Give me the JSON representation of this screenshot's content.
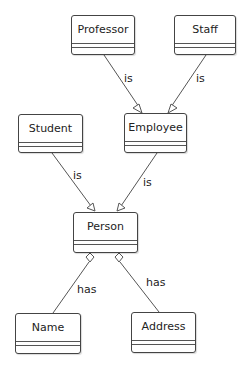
{
  "diagram": {
    "type": "uml-class-diagram",
    "classes": [
      {
        "id": "professor",
        "name": "Professor"
      },
      {
        "id": "staff",
        "name": "Staff"
      },
      {
        "id": "student",
        "name": "Student"
      },
      {
        "id": "employee",
        "name": "Employee"
      },
      {
        "id": "person",
        "name": "Person"
      },
      {
        "id": "name",
        "name": "Name"
      },
      {
        "id": "address",
        "name": "Address"
      }
    ],
    "relationships": [
      {
        "from": "Professor",
        "to": "Employee",
        "kind": "generalization",
        "label": "is"
      },
      {
        "from": "Staff",
        "to": "Employee",
        "kind": "generalization",
        "label": "is"
      },
      {
        "from": "Student",
        "to": "Person",
        "kind": "generalization",
        "label": "is"
      },
      {
        "from": "Employee",
        "to": "Person",
        "kind": "generalization",
        "label": "is"
      },
      {
        "from": "Person",
        "to": "Name",
        "kind": "aggregation",
        "label": "has"
      },
      {
        "from": "Person",
        "to": "Address",
        "kind": "aggregation",
        "label": "has"
      }
    ]
  }
}
